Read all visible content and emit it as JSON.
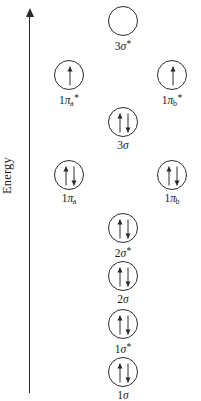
{
  "axis": {
    "label": "Energy",
    "direction": "up",
    "arrow_icon": "arrow-up-icon"
  },
  "diagram": {
    "type": "molecular-orbital-energy-diagram",
    "columns": [
      "left",
      "center",
      "right"
    ],
    "stroke_color": "#2b2b2b",
    "background_color": "#ffffff"
  },
  "orbitals": [
    {
      "id": "3sigma-star",
      "prefix": "3",
      "symbol": "σ",
      "subscript": "",
      "superscript": "*",
      "label_text": "3σ*",
      "electrons": 0,
      "spins": [],
      "column": "center",
      "x": 108,
      "y": 6
    },
    {
      "id": "1pi-a-star",
      "prefix": "1",
      "symbol": "π",
      "subscript": "a",
      "superscript": "*",
      "label_text": "1πa*",
      "electrons": 1,
      "spins": [
        "up"
      ],
      "column": "left",
      "x": 54,
      "y": 60
    },
    {
      "id": "1pi-b-star",
      "prefix": "1",
      "symbol": "π",
      "subscript": "b",
      "superscript": "*",
      "label_text": "1πb*",
      "electrons": 1,
      "spins": [
        "up"
      ],
      "column": "right",
      "x": 157,
      "y": 60
    },
    {
      "id": "3sigma",
      "prefix": "3",
      "symbol": "σ",
      "subscript": "",
      "superscript": "",
      "label_text": "3σ",
      "electrons": 2,
      "spins": [
        "up",
        "down"
      ],
      "column": "center",
      "x": 108,
      "y": 107
    },
    {
      "id": "1pi-a",
      "prefix": "1",
      "symbol": "π",
      "subscript": "a",
      "superscript": "",
      "label_text": "1πa",
      "electrons": 2,
      "spins": [
        "up",
        "down"
      ],
      "column": "left",
      "x": 54,
      "y": 160
    },
    {
      "id": "1pi-b",
      "prefix": "1",
      "symbol": "π",
      "subscript": "b",
      "superscript": "",
      "label_text": "1πb",
      "electrons": 2,
      "spins": [
        "up",
        "down"
      ],
      "column": "right",
      "x": 157,
      "y": 160
    },
    {
      "id": "2sigma-star",
      "prefix": "2",
      "symbol": "σ",
      "subscript": "",
      "superscript": "*",
      "label_text": "2σ*",
      "electrons": 2,
      "spins": [
        "up",
        "down"
      ],
      "column": "center",
      "x": 108,
      "y": 213
    },
    {
      "id": "2sigma",
      "prefix": "2",
      "symbol": "σ",
      "subscript": "",
      "superscript": "",
      "label_text": "2σ",
      "electrons": 2,
      "spins": [
        "up",
        "down"
      ],
      "column": "center",
      "x": 108,
      "y": 261
    },
    {
      "id": "1sigma-star",
      "prefix": "1",
      "symbol": "σ",
      "subscript": "",
      "superscript": "*",
      "label_text": "1σ*",
      "electrons": 2,
      "spins": [
        "up",
        "down"
      ],
      "column": "center",
      "x": 108,
      "y": 309
    },
    {
      "id": "1sigma",
      "prefix": "1",
      "symbol": "σ",
      "subscript": "",
      "superscript": "",
      "label_text": "1σ",
      "electrons": 2,
      "spins": [
        "up",
        "down"
      ],
      "column": "center",
      "x": 108,
      "y": 357
    }
  ]
}
